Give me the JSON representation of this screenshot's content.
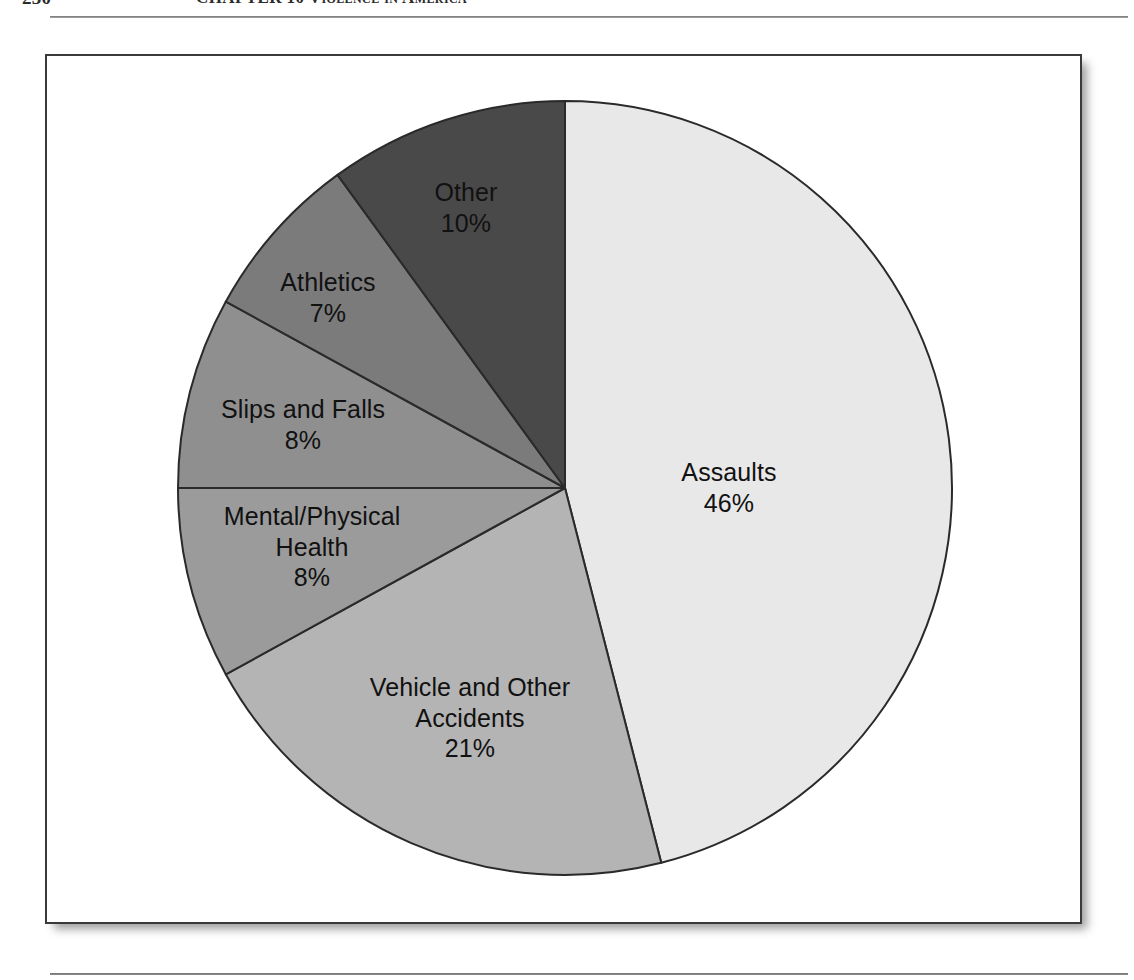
{
  "page": {
    "folio": "230",
    "running_title": "CHAPTER 10   Violence in America"
  },
  "figure": {
    "frame_label": "figure-border"
  },
  "chart_data": {
    "type": "pie",
    "title": "",
    "subtitle": "",
    "xlabel": "",
    "ylabel": "",
    "legend_position": "inside-slices",
    "grid": false,
    "units": "percent",
    "start_angle_deg": 0,
    "direction": "clockwise",
    "categories": [
      "Assaults",
      "Vehicle and Other Accidents",
      "Mental/Physical Health",
      "Slips and Falls",
      "Athletics",
      "Other"
    ],
    "values": [
      46,
      21,
      8,
      8,
      7,
      10
    ],
    "total": 100,
    "slices": [
      {
        "label": "Assaults",
        "value": 46,
        "value_text": "46%",
        "color": "#e8e8e8",
        "label_x": 729,
        "label_y": 487
      },
      {
        "label": "Vehicle and Other\nAccidents",
        "value": 21,
        "value_text": "21%",
        "color": "#b4b4b4",
        "label_x": 470,
        "label_y": 718
      },
      {
        "label": "Mental/Physical\nHealth",
        "value": 8,
        "value_text": "8%",
        "color": "#9b9b9b",
        "label_x": 312,
        "label_y": 547
      },
      {
        "label": "Slips and Falls",
        "value": 8,
        "value_text": "8%",
        "color": "#8f8f8f",
        "label_x": 303,
        "label_y": 424
      },
      {
        "label": "Athletics",
        "value": 7,
        "value_text": "7%",
        "color": "#7b7b7b",
        "label_x": 328,
        "label_y": 297
      },
      {
        "label": "Other",
        "value": 10,
        "value_text": "10%",
        "color": "#494949",
        "label_x": 466,
        "label_y": 207
      }
    ]
  }
}
